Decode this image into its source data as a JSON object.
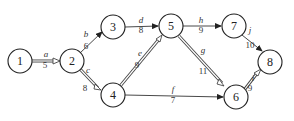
{
  "diagram": {
    "type": "activity-network",
    "nodes": [
      {
        "id": "1",
        "label": "1",
        "x": 20,
        "y": 61
      },
      {
        "id": "2",
        "label": "2",
        "x": 72,
        "y": 61
      },
      {
        "id": "3",
        "label": "3",
        "x": 113,
        "y": 27
      },
      {
        "id": "4",
        "label": "4",
        "x": 113,
        "y": 95
      },
      {
        "id": "5",
        "label": "5",
        "x": 171,
        "y": 26
      },
      {
        "id": "6",
        "label": "6",
        "x": 236,
        "y": 97
      },
      {
        "id": "7",
        "label": "7",
        "x": 234,
        "y": 26
      },
      {
        "id": "8",
        "label": "8",
        "x": 270,
        "y": 62
      }
    ],
    "edges": [
      {
        "id": "a",
        "from": "1",
        "to": "2",
        "name": "a",
        "weight": "5",
        "critical": true
      },
      {
        "id": "b",
        "from": "2",
        "to": "3",
        "name": "b",
        "weight": "6",
        "critical": false
      },
      {
        "id": "c",
        "from": "2",
        "to": "4",
        "name": "c",
        "weight": "8",
        "critical": true
      },
      {
        "id": "d",
        "from": "3",
        "to": "5",
        "name": "d",
        "weight": "8",
        "critical": false
      },
      {
        "id": "e",
        "from": "4",
        "to": "5",
        "name": "e",
        "weight": "9",
        "critical": true
      },
      {
        "id": "f",
        "from": "4",
        "to": "6",
        "name": "f",
        "weight": "7",
        "critical": false
      },
      {
        "id": "g",
        "from": "5",
        "to": "6",
        "name": "g",
        "weight": "11",
        "critical": true
      },
      {
        "id": "h",
        "from": "5",
        "to": "7",
        "name": "h",
        "weight": "9",
        "critical": false
      },
      {
        "id": "j",
        "from": "7",
        "to": "8",
        "name": "j",
        "weight": "10",
        "critical": false
      },
      {
        "id": "i",
        "from": "6",
        "to": "8",
        "name": "i",
        "weight": "9",
        "critical": true
      }
    ]
  }
}
